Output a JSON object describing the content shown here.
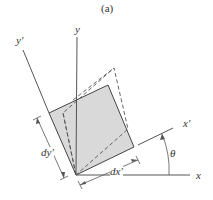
{
  "figure": {
    "caption": "(a)",
    "labels": {
      "y": "y",
      "y_prime": "y′",
      "x": "x",
      "x_prime": "x′",
      "theta": "θ",
      "dx_prime": "dx′",
      "dy_prime": "dy′"
    },
    "colors": {
      "line": "#444444",
      "fill": "#d9d9d9",
      "dash": "#555555"
    },
    "elements": {
      "original_axes": "x horizontal, y vertical",
      "rotated_axes": "x′, y′ rotated by θ",
      "solid_element": "shaded rotated square dx′ by dy′",
      "deformed_element": "dashed parallelogram"
    }
  }
}
